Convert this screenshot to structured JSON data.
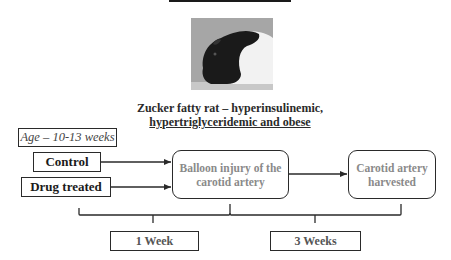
{
  "figure": {
    "photo": {
      "subject": "Zucker fatty rat photograph",
      "icon": "rat-photo"
    },
    "caption": {
      "line1": "Zucker fatty rat – hyperinsulinemic,",
      "line2": "hypertriglyceridemic and obese"
    },
    "age_label": "Age – 10-13 weeks",
    "groups": [
      {
        "label": "Control"
      },
      {
        "label": "Drug treated"
      }
    ],
    "steps": [
      {
        "label_line1": "Balloon injury of the",
        "label_line2": "carotid artery"
      },
      {
        "label_line1": "Carotid artery",
        "label_line2": "harvested"
      }
    ],
    "durations": [
      {
        "label": "1 Week"
      },
      {
        "label": "3 Weeks"
      }
    ],
    "colors": {
      "line": "#2a2a2a",
      "step_text": "#8a8a8a"
    }
  }
}
